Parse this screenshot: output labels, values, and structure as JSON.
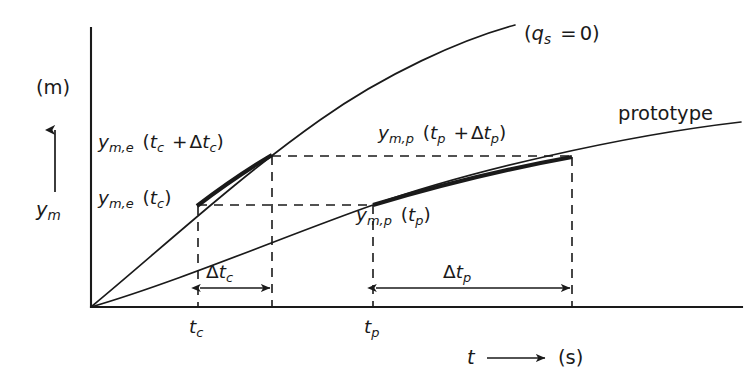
{
  "figure": {
    "type": "line-diagram",
    "axes": {
      "y_unit_label": "(m)",
      "y_axis_label": "y_m",
      "x_axis_label": "t",
      "x_unit_label": "(s)",
      "y_axis_arrow": "up-arrow",
      "x_axis_arrow": "right-arrow"
    },
    "curves": [
      {
        "name": "model-curve",
        "annotation": "(q_s = 0)",
        "emphasis_segment": "t_c to t_c + Δt_c"
      },
      {
        "name": "prototype-curve",
        "annotation": "prototype",
        "emphasis_segment": "t_p to t_p + Δt_p"
      }
    ],
    "labels": {
      "y_me_tc_dtc": "y_m,e (t_c + Δt_c)",
      "y_me_tc": "y_m,e (t_c)",
      "y_mp_tp_dtp": "y_m,p (t_p + Δt_p)",
      "y_mp_tp": "y_m,p (t_p)",
      "qs_zero": "(q_s = 0)",
      "prototype": "prototype",
      "delta_tc": "Δt_c",
      "delta_tp": "Δt_p",
      "tick_tc": "t_c",
      "tick_tp": "t_p"
    },
    "colors": {
      "ink": "#1a1a1a",
      "background": "#ffffff"
    }
  }
}
